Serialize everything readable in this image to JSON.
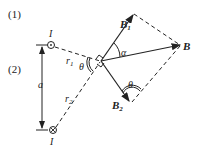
{
  "parts": {
    "p1": "(1)",
    "p2": "(2)"
  },
  "labels": {
    "I_top": "I",
    "I_bottom": "I",
    "r1": "r",
    "r1_sub": "1",
    "r2": "r",
    "r2_sub": "2",
    "a": "a",
    "theta_left": "θ",
    "theta_right": "θ",
    "alpha": "α",
    "B1": "B",
    "B1_sub": "1",
    "B": "B",
    "B2": "B",
    "B2_sub": "2"
  },
  "colors": {
    "ink": "#222222",
    "background": "#ffffff"
  }
}
